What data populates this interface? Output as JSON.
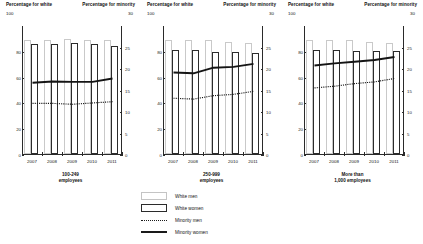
{
  "axis_headers": {
    "left_title": "Percentage for white",
    "left_top_value": "100",
    "right_title": "Percentage for minority",
    "right_top_value": "30"
  },
  "legend": {
    "items": [
      {
        "label": "White men",
        "key": "men"
      },
      {
        "label": "White women",
        "key": "women"
      },
      {
        "label": "Minority men",
        "key": "dotted"
      },
      {
        "label": "Minority women",
        "key": "solid"
      }
    ]
  },
  "chart_data": [
    {
      "type": "bar",
      "panel_index": 0,
      "title": "100-249\nemployees",
      "title_lines": [
        "100-249",
        "employees"
      ],
      "categories": [
        "2007",
        "2008",
        "2009",
        "2010",
        "2011"
      ],
      "xlabel": "",
      "ylabel": "Percentage for white",
      "ylabel_right": "Percentage for minority",
      "ylim": [
        0,
        100
      ],
      "ylim_right": [
        0,
        30
      ],
      "yticks": [
        0,
        20,
        40,
        60,
        80
      ],
      "yticks_right": [
        0,
        5,
        10,
        15,
        20,
        25
      ],
      "grid": false,
      "legend_position": "below-center",
      "series": [
        {
          "name": "White men",
          "axis": "left",
          "render": "bar",
          "values": [
            88,
            88,
            89,
            88,
            88
          ]
        },
        {
          "name": "White women",
          "axis": "left",
          "render": "bar",
          "values": [
            85,
            85,
            86,
            85,
            84
          ]
        },
        {
          "name": "Minority men",
          "axis": "right",
          "render": "dotted-line",
          "values": [
            12.0,
            12.0,
            11.8,
            12.1,
            12.4
          ]
        },
        {
          "name": "Minority women",
          "axis": "right",
          "render": "solid-line",
          "values": [
            16.8,
            17.1,
            17.0,
            17.0,
            17.8
          ]
        }
      ]
    },
    {
      "type": "bar",
      "panel_index": 1,
      "title": "250-999\nemployees",
      "title_lines": [
        "250-999",
        "employees"
      ],
      "categories": [
        "2007",
        "2008",
        "2009",
        "2010",
        "2011"
      ],
      "xlabel": "",
      "ylabel": "Percentage for white",
      "ylabel_right": "Percentage for minority",
      "ylim": [
        0,
        100
      ],
      "ylim_right": [
        0,
        30
      ],
      "yticks": [
        0,
        20,
        40,
        60,
        80
      ],
      "yticks_right": [
        0,
        5,
        10,
        15,
        20,
        25
      ],
      "grid": false,
      "legend_position": "below-center",
      "series": [
        {
          "name": "White men",
          "axis": "left",
          "render": "bar",
          "values": [
            88,
            88,
            88,
            87,
            86
          ]
        },
        {
          "name": "White women",
          "axis": "left",
          "render": "bar",
          "values": [
            81,
            81,
            79,
            79,
            78
          ]
        },
        {
          "name": "Minority men",
          "axis": "right",
          "render": "dotted-line",
          "values": [
            13.2,
            13.0,
            13.8,
            14.1,
            14.8
          ]
        },
        {
          "name": "Minority women",
          "axis": "right",
          "render": "solid-line",
          "values": [
            19.2,
            19.0,
            20.3,
            20.5,
            21.2
          ]
        }
      ]
    },
    {
      "type": "bar",
      "panel_index": 2,
      "title": "More than\n1,000 employees",
      "title_lines": [
        "More than",
        "1,000 employees"
      ],
      "categories": [
        "2007",
        "2008",
        "2009",
        "2010",
        "2011"
      ],
      "xlabel": "",
      "ylabel": "Percentage for white",
      "ylabel_right": "Percentage for minority",
      "ylim": [
        0,
        100
      ],
      "ylim_right": [
        0,
        30
      ],
      "yticks": [
        0,
        20,
        40,
        60,
        80
      ],
      "yticks_right": [
        0,
        5,
        10,
        15,
        20,
        25
      ],
      "grid": false,
      "legend_position": "below-center",
      "series": [
        {
          "name": "White men",
          "axis": "left",
          "render": "bar",
          "values": [
            88,
            88,
            88,
            87,
            86
          ]
        },
        {
          "name": "White women",
          "axis": "left",
          "render": "bar",
          "values": [
            81,
            81,
            80,
            80,
            80
          ]
        },
        {
          "name": "Minority men",
          "axis": "right",
          "render": "dotted-line",
          "values": [
            15.6,
            16.0,
            16.6,
            17.0,
            17.8
          ]
        },
        {
          "name": "Minority women",
          "axis": "right",
          "render": "solid-line",
          "values": [
            20.8,
            21.3,
            21.7,
            22.1,
            22.8
          ]
        }
      ]
    }
  ]
}
